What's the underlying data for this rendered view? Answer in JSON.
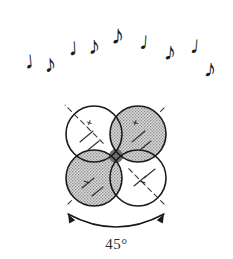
{
  "figure": {
    "background_color": "#ffffff",
    "ink_color": "#1a1a1a"
  },
  "music": {
    "description": "Arc of nine musical notes rising from lower left to apex then falling to lower right",
    "count": 9,
    "notes": [
      {
        "glyph": "♩",
        "type": "quarter-note",
        "x": 24,
        "y": 47,
        "size": 25,
        "rotate": -6
      },
      {
        "glyph": "♪",
        "type": "eighth-note",
        "x": 44,
        "y": 51,
        "size": 25,
        "rotate": -4
      },
      {
        "glyph": "♩",
        "type": "quarter-note",
        "x": 68,
        "y": 34,
        "size": 25,
        "rotate": -3
      },
      {
        "glyph": "♪",
        "type": "eighth-note",
        "x": 88,
        "y": 33,
        "size": 25,
        "rotate": -2
      },
      {
        "glyph": "♪",
        "type": "eighth-note",
        "x": 111,
        "y": 22,
        "size": 27,
        "rotate": 2
      },
      {
        "glyph": "♩",
        "type": "quarter-note",
        "x": 139,
        "y": 29,
        "size": 25,
        "rotate": 4
      },
      {
        "glyph": "♪",
        "type": "eighth-note",
        "x": 164,
        "y": 39,
        "size": 25,
        "rotate": 5
      },
      {
        "glyph": "♩",
        "type": "quarter-note",
        "x": 190,
        "y": 33,
        "size": 25,
        "rotate": 5
      },
      {
        "glyph": "♪",
        "type": "eighth-note",
        "x": 204,
        "y": 56,
        "size": 25,
        "rotate": 6
      }
    ]
  },
  "orbital": {
    "description": "Four overlapping circles forming a four-petal d-orbital, alternating shaded and unshaded quadrants",
    "center": {
      "x": 116,
      "y": 156
    },
    "circle_radius": 28,
    "circle_offset": 22,
    "outline_color": "#1a1a1a",
    "outline_width": 1.6,
    "shade_color": "#9a9a9a",
    "shade_background": "#d8d8d8",
    "lobes": [
      {
        "position": "top-left",
        "cx": 94,
        "cy": 134,
        "shaded": false,
        "sign": "+",
        "sign_x": 88,
        "sign_y": 126
      },
      {
        "position": "top-right",
        "cx": 138,
        "cy": 134,
        "shaded": true,
        "sign": "+",
        "sign_x": 134,
        "sign_y": 126
      },
      {
        "position": "bottom-left",
        "cx": 94,
        "cy": 178,
        "shaded": true,
        "sign": "−",
        "sign_x": 85,
        "sign_y": 186
      },
      {
        "position": "bottom-right",
        "cx": 138,
        "cy": 178,
        "shaded": false,
        "sign": "−",
        "sign_x": 141,
        "sign_y": 186
      }
    ],
    "axes": {
      "description": "Dashed diagonal axis lines radiating through the orbital centre at 45 degrees",
      "style": "dashed",
      "color": "#3a3a3a",
      "dash": "5 4",
      "inner_radius": 18,
      "outer_radius": 72
    }
  },
  "rotation_arrow": {
    "description": "Double-headed curved arrow beneath the orbital indicating the rotation span",
    "color": "#1a1a1a",
    "start": {
      "x": 68,
      "y": 214
    },
    "end": {
      "x": 164,
      "y": 214
    },
    "control": {
      "x": 116,
      "y": 240
    },
    "double_headed": true
  },
  "angle": {
    "value": "45",
    "unit": "°",
    "label": "45°",
    "x": 116,
    "y": 236,
    "font_size": 15
  }
}
